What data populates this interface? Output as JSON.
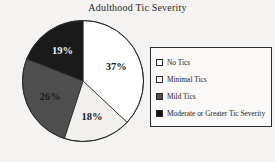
{
  "chart_data": {
    "type": "pie",
    "title": "Adulthood Tic Severity",
    "categories": [
      "No Tics",
      "Minimal Tics",
      "Mild Tics",
      "Moderate or Greater Tic Severity"
    ],
    "values": [
      37,
      18,
      26,
      19
    ],
    "value_labels": [
      "37%",
      "18%",
      "26%",
      "19%"
    ],
    "colors": [
      "#ffffff",
      "#f2f0ec",
      "#4f4f4f",
      "#1a1a1a"
    ],
    "label_text_colors": [
      "#1b1b1b",
      "#1b1b1b",
      "#1b1b1b",
      "#f2f2f2"
    ],
    "legend_position": "right",
    "start_angle_deg": 0,
    "direction": "clockwise",
    "xlabel": "",
    "ylabel": ""
  },
  "legend": {
    "items": [
      {
        "label": "No Tics",
        "swatch": "#ffffff"
      },
      {
        "label": "Minimal Tics",
        "swatch": "#f7f5f1"
      },
      {
        "label": "Mild Tics",
        "swatch": "#4f4f4f"
      },
      {
        "label": "Moderate or Greater Tic Severity",
        "swatch": "#151515"
      }
    ]
  }
}
